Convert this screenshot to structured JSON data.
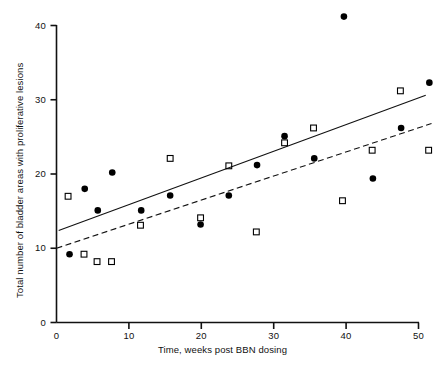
{
  "chart_data": {
    "type": "scatter",
    "title": "",
    "xlabel": "Time, weeks post BBN dosing",
    "ylabel": "Total number of bladder areas with proliferative lesions",
    "xlim": [
      0,
      50
    ],
    "ylim": [
      0,
      40
    ],
    "xticks": [
      0,
      10,
      20,
      30,
      40,
      50
    ],
    "yticks": [
      0,
      10,
      20,
      30,
      40
    ],
    "xtick_labels": [
      "0",
      "10",
      "20",
      "30",
      "40",
      "50"
    ],
    "ytick_labels": [
      "0",
      "10",
      "20",
      "30",
      "40"
    ],
    "grid": false,
    "legend": "none",
    "series": [
      {
        "name": "filled-circle-group",
        "marker": "filled-circle",
        "color": "#000000",
        "points": [
          {
            "x": 1.8,
            "y": 9.2
          },
          {
            "x": 3.9,
            "y": 18.0
          },
          {
            "x": 5.7,
            "y": 15.1
          },
          {
            "x": 7.7,
            "y": 20.2
          },
          {
            "x": 11.7,
            "y": 15.1
          },
          {
            "x": 15.7,
            "y": 17.1
          },
          {
            "x": 19.9,
            "y": 13.2
          },
          {
            "x": 23.8,
            "y": 17.1
          },
          {
            "x": 27.7,
            "y": 21.2
          },
          {
            "x": 31.5,
            "y": 25.1
          },
          {
            "x": 35.6,
            "y": 22.1
          },
          {
            "x": 39.7,
            "y": 41.2
          },
          {
            "x": 43.7,
            "y": 19.4
          },
          {
            "x": 47.6,
            "y": 26.2
          },
          {
            "x": 51.5,
            "y": 32.3
          }
        ]
      },
      {
        "name": "open-square-group",
        "marker": "open-square",
        "color": "#000000",
        "points": [
          {
            "x": 1.6,
            "y": 17.0
          },
          {
            "x": 3.8,
            "y": 9.2
          },
          {
            "x": 5.6,
            "y": 8.2
          },
          {
            "x": 7.6,
            "y": 8.2
          },
          {
            "x": 11.6,
            "y": 13.1
          },
          {
            "x": 15.7,
            "y": 22.1
          },
          {
            "x": 19.9,
            "y": 14.1
          },
          {
            "x": 23.8,
            "y": 21.1
          },
          {
            "x": 27.6,
            "y": 12.2
          },
          {
            "x": 31.5,
            "y": 24.2
          },
          {
            "x": 35.5,
            "y": 26.2
          },
          {
            "x": 39.5,
            "y": 16.4
          },
          {
            "x": 43.6,
            "y": 23.2
          },
          {
            "x": 47.5,
            "y": 31.2
          },
          {
            "x": 51.4,
            "y": 23.2
          }
        ]
      }
    ],
    "trend_lines": [
      {
        "name": "solid-regression-line",
        "style": "solid",
        "x0": 0.3,
        "y0": 12.4,
        "x1": 51.0,
        "y1": 30.6
      },
      {
        "name": "dashed-regression-line",
        "style": "dashed",
        "x0": 0.0,
        "y0": 10.0,
        "x1": 51.8,
        "y1": 26.8
      }
    ]
  }
}
